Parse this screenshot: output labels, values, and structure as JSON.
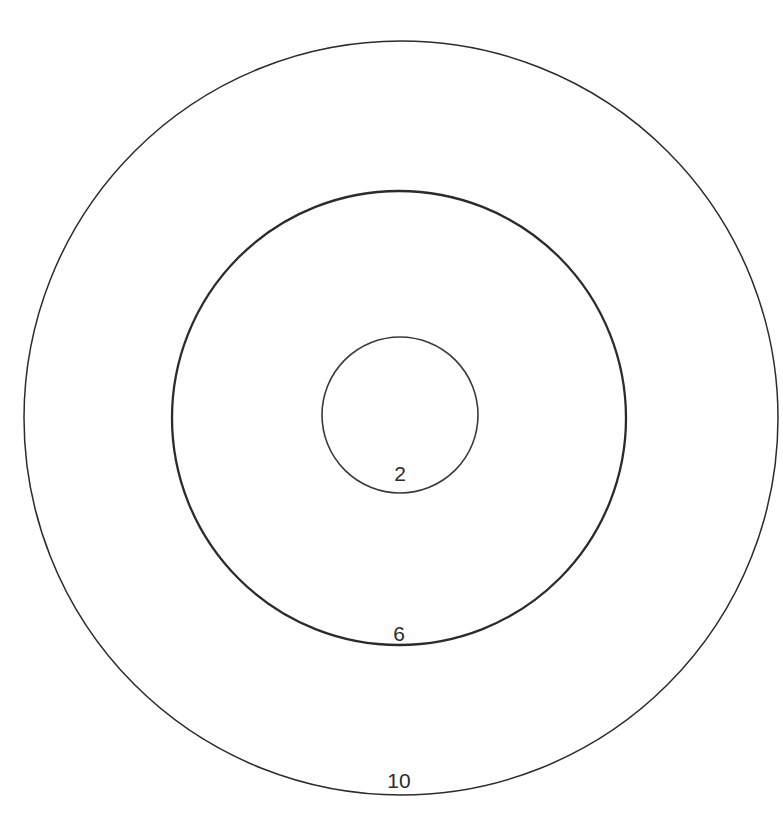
{
  "figure": {
    "background_color": "#ffffff",
    "stroke_color": "#2b2b2b",
    "label_color": "#2b2b2b",
    "center": {
      "x": 400,
      "y": 418
    }
  },
  "chart_data": {
    "type": "scatter",
    "title": "",
    "subtitle": "",
    "xlabel": "",
    "ylabel": "",
    "grid": false,
    "legend": "none",
    "center": {
      "x": 400,
      "y": 418
    },
    "pixels_per_unit": 37.7,
    "categories": [
      "2",
      "6",
      "10"
    ],
    "values": [
      2,
      6,
      10
    ],
    "series": [
      {
        "name": "circle radius",
        "values": [
          2,
          6,
          10
        ]
      },
      {
        "name": "radius in pixels",
        "values": [
          78,
          227,
          377
        ]
      }
    ],
    "circles": [
      {
        "name": "inner-circle",
        "label": "2",
        "radius_units": 2,
        "radius_px": 78,
        "cx": 400,
        "cy": 415,
        "stroke_width": 1.6,
        "stroke_color": "#3a3a3a",
        "fill": "none",
        "label_x": 400,
        "label_y": 481
      },
      {
        "name": "middle-circle",
        "label": "6",
        "radius_units": 6,
        "radius_px": 227,
        "cx": 399,
        "cy": 418,
        "stroke_width": 2.3,
        "stroke_color": "#2b2b2b",
        "fill": "none",
        "label_x": 399,
        "label_y": 641
      },
      {
        "name": "outer-circle",
        "label": "10",
        "radius_units": 10,
        "radius_px": 377,
        "cx": 401,
        "cy": 418,
        "stroke_width": 1.5,
        "stroke_color": "#2b2b2b",
        "fill": "none",
        "label_x": 399,
        "label_y": 788
      }
    ],
    "labels": [
      {
        "text": "2",
        "x": 400,
        "y": 481
      },
      {
        "text": "6",
        "x": 399,
        "y": 641
      },
      {
        "text": "10",
        "x": 399,
        "y": 788
      }
    ]
  }
}
